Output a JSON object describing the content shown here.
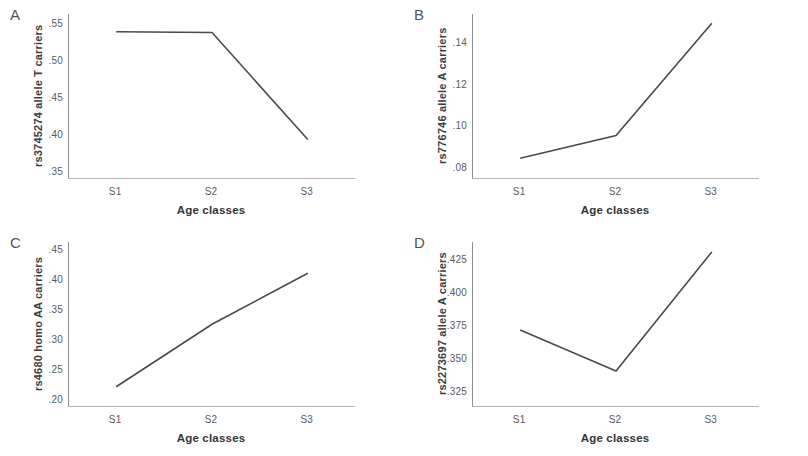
{
  "figure": {
    "background_color": "#ffffff",
    "line_color": "#4a4a4a",
    "axis_color": "#8d8d8d",
    "text_color": "#3d3d3d",
    "x_axis_title": "Age classes",
    "x_categories": [
      "S1",
      "S2",
      "S3"
    ]
  },
  "panels": [
    {
      "letter": "A",
      "y_label": "rs3745274 allele T carriers",
      "y_ticks": [
        ".55",
        ".50",
        ".45",
        ".40",
        ".35"
      ],
      "x_title": "Age classes",
      "x_ticks": [
        "S1",
        "S2",
        "S3"
      ]
    },
    {
      "letter": "B",
      "y_label": "rs776746 allele A carriers",
      "y_ticks": [
        ".14",
        ".12",
        ".10",
        ".08"
      ],
      "x_title": "Age classes",
      "x_ticks": [
        "S1",
        "S2",
        "S3"
      ]
    },
    {
      "letter": "C",
      "y_label": "rs4680 homo AA carriers",
      "y_ticks": [
        ".45",
        ".40",
        ".35",
        ".30",
        ".25",
        ".20"
      ],
      "x_title": "Age classes",
      "x_ticks": [
        "S1",
        "S2",
        "S3"
      ]
    },
    {
      "letter": "D",
      "y_label": "rs2273697  allele A carriers",
      "y_ticks": [
        ".425",
        ".400",
        ".375",
        ".350",
        ".325"
      ],
      "x_title": "Age classes",
      "x_ticks": [
        "S1",
        "S2",
        "S3"
      ]
    }
  ],
  "chart_data": [
    {
      "type": "line",
      "panel": "A",
      "title": "",
      "xlabel": "Age classes",
      "ylabel": "rs3745274 allele T carriers",
      "categories": [
        "S1",
        "S2",
        "S3"
      ],
      "values": [
        0.538,
        0.537,
        0.392
      ],
      "ytick_values": [
        0.55,
        0.5,
        0.45,
        0.4,
        0.35
      ],
      "ytick_labels": [
        ".55",
        ".50",
        ".45",
        ".40",
        ".35"
      ],
      "ylim": [
        0.34,
        0.562
      ],
      "grid": false,
      "legend": false
    },
    {
      "type": "line",
      "panel": "B",
      "title": "",
      "xlabel": "Age classes",
      "ylabel": "rs776746 allele A carriers",
      "categories": [
        "S1",
        "S2",
        "S3"
      ],
      "values": [
        0.084,
        0.095,
        0.149
      ],
      "ytick_values": [
        0.14,
        0.12,
        0.1,
        0.08
      ],
      "ytick_labels": [
        ".14",
        ".12",
        ".10",
        ".08"
      ],
      "ylim": [
        0.0745,
        0.1535
      ],
      "grid": false,
      "legend": false
    },
    {
      "type": "line",
      "panel": "C",
      "title": "",
      "xlabel": "Age classes",
      "ylabel": "rs4680 homo AA carriers",
      "categories": [
        "S1",
        "S2",
        "S3"
      ],
      "values": [
        0.221,
        0.325,
        0.41
      ],
      "ytick_values": [
        0.45,
        0.4,
        0.35,
        0.3,
        0.25,
        0.2
      ],
      "ytick_labels": [
        ".45",
        ".40",
        ".35",
        ".30",
        ".25",
        ".20"
      ],
      "ylim": [
        0.189,
        0.462
      ],
      "grid": false,
      "legend": false
    },
    {
      "type": "line",
      "panel": "D",
      "title": "",
      "xlabel": "Age classes",
      "ylabel": "rs2273697 allele A carriers",
      "categories": [
        "S1",
        "S2",
        "S3"
      ],
      "values": [
        0.371,
        0.34,
        0.43
      ],
      "ytick_values": [
        0.425,
        0.4,
        0.375,
        0.35,
        0.325
      ],
      "ytick_labels": [
        ".425",
        ".400",
        ".375",
        ".350",
        ".325"
      ],
      "ylim": [
        0.3135,
        0.4375
      ],
      "grid": false,
      "legend": false
    }
  ]
}
